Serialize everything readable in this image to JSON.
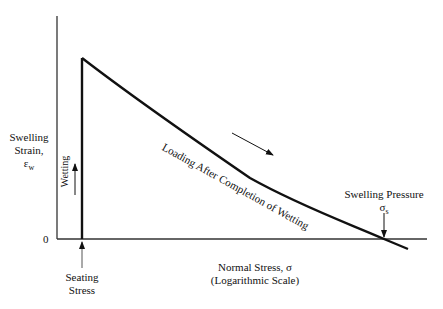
{
  "diagram": {
    "y_axis": {
      "label_line1": "Swelling",
      "label_line2": "Strain,",
      "label_symbol": "ε",
      "label_subscript": "w",
      "zero_label": "0"
    },
    "x_axis": {
      "label_line1": "Normal Stress, σ",
      "label_line2": "(Logarithmic Scale)"
    },
    "annotations": {
      "wetting": "Wetting",
      "loading": "Loading After Completion of Wetting",
      "seating_line1": "Seating",
      "seating_line2": "Stress",
      "swelling_pressure": "Swelling Pressure",
      "swelling_pressure_symbol": "σ",
      "swelling_pressure_subscript": "s"
    },
    "colors": {
      "line": "#111111",
      "background": "#ffffff"
    }
  }
}
